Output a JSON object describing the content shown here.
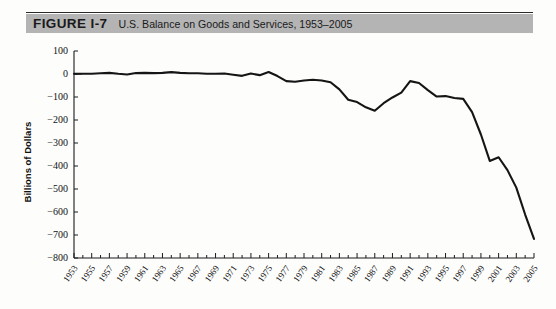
{
  "figure": {
    "label": "FIGURE I-7",
    "caption": "U.S. Balance on Goods and Services, 1953–2005",
    "banner_color": "#b4b4b4",
    "line_color": "#151515"
  },
  "chart_data": {
    "type": "line",
    "title": "U.S. Balance on Goods and Services, 1953–2005",
    "xlabel": "",
    "ylabel": "Billions of Dollars",
    "ylim": [
      -800,
      100
    ],
    "xlim": [
      1953,
      2005
    ],
    "grid": false,
    "legend": null,
    "ytick_labels": [
      "100",
      "0",
      "−100",
      "−200",
      "−300",
      "−400",
      "−500",
      "−600",
      "−700",
      "−800"
    ],
    "yticks": [
      100,
      0,
      -100,
      -200,
      -300,
      -400,
      -500,
      -600,
      -700,
      -800
    ],
    "xtick_labels": [
      "1953",
      "1955",
      "1957",
      "1959",
      "1961",
      "1963",
      "1965",
      "1967",
      "1969",
      "1971",
      "1973",
      "1975",
      "1977",
      "1979",
      "1981",
      "1983",
      "1985",
      "1987",
      "1989",
      "1991",
      "1993",
      "1995",
      "1997",
      "1999",
      "2001",
      "2003",
      "2005"
    ],
    "xticks": [
      1953,
      1955,
      1957,
      1959,
      1961,
      1963,
      1965,
      1967,
      1969,
      1971,
      1973,
      1975,
      1977,
      1979,
      1981,
      1983,
      1985,
      1987,
      1989,
      1991,
      1993,
      1995,
      1997,
      1999,
      2001,
      2003,
      2005
    ],
    "x": [
      1953,
      1954,
      1955,
      1956,
      1957,
      1958,
      1959,
      1960,
      1961,
      1962,
      1963,
      1964,
      1965,
      1966,
      1967,
      1968,
      1969,
      1970,
      1971,
      1972,
      1973,
      1974,
      1975,
      1976,
      1977,
      1978,
      1979,
      1980,
      1981,
      1982,
      1983,
      1984,
      1985,
      1986,
      1987,
      1988,
      1989,
      1990,
      1991,
      1992,
      1993,
      1994,
      1995,
      1996,
      1997,
      1998,
      1999,
      2000,
      2001,
      2002,
      2003,
      2004,
      2005
    ],
    "values": [
      1,
      1,
      1,
      3,
      5,
      1,
      -2,
      4,
      5,
      4,
      5,
      8,
      5,
      3,
      3,
      1,
      1,
      2,
      -3,
      -8,
      2,
      -5,
      9,
      -9,
      -31,
      -34,
      -28,
      -25,
      -28,
      -36,
      -67,
      -112,
      -122,
      -145,
      -160,
      -127,
      -102,
      -81,
      -31,
      -39,
      -70,
      -98,
      -96,
      -104,
      -108,
      -166,
      -263,
      -378,
      -362,
      -418,
      -494,
      -611,
      -717
    ],
    "annotations": []
  },
  "axis": {
    "y_title": "Billions of Dollars"
  }
}
